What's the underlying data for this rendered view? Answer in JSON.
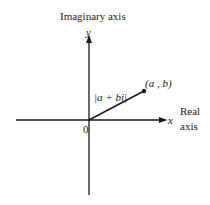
{
  "diagram": {
    "axes": {
      "vertical": {
        "title": "Imaginary axis",
        "symbol": "y"
      },
      "horizontal": {
        "title_line1": "Real",
        "title_line2": "axis",
        "symbol": "x"
      },
      "origin": "0"
    },
    "point": {
      "label": "(a , b)"
    },
    "vector": {
      "label": "|a + bi|"
    },
    "colors": {
      "ink": "#1a1a1a",
      "background": "#ffffff"
    }
  }
}
